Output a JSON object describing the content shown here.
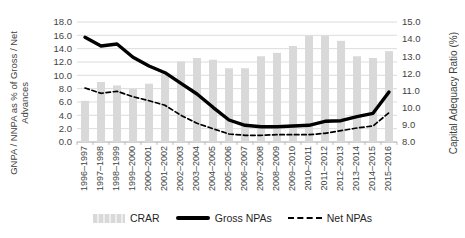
{
  "chart_data": {
    "type": "bar",
    "subtype": "combo-bar-line-dual-axis",
    "categories": [
      "1996–1997",
      "1997–1998",
      "1998–1999",
      "1999–2000",
      "2000–2001",
      "2001–2002",
      "2002–2003",
      "2003–2004",
      "2004–2005",
      "2005–2006",
      "2006–2007",
      "2007–2008",
      "2008–2009",
      "2009–2010",
      "2010–2011",
      "2011–2012",
      "2012–2013",
      "2013–2014",
      "2014–2015",
      "2015–2016"
    ],
    "series": [
      {
        "name": "CRAR",
        "type": "bar",
        "axis": "right",
        "style": "solid",
        "values": [
          10.4,
          11.5,
          11.3,
          11.1,
          11.4,
          12.0,
          12.7,
          12.9,
          12.8,
          12.3,
          12.3,
          13.0,
          13.2,
          13.6,
          14.2,
          14.2,
          13.9,
          13.0,
          12.9,
          13.3
        ]
      },
      {
        "name": "Gross NPAs",
        "type": "line",
        "axis": "left",
        "style": "solid",
        "values": [
          15.7,
          14.4,
          14.7,
          12.7,
          11.4,
          10.4,
          8.8,
          7.2,
          5.2,
          3.3,
          2.5,
          2.3,
          2.3,
          2.4,
          2.5,
          3.1,
          3.2,
          3.8,
          4.3,
          7.5
        ]
      },
      {
        "name": "Net NPAs",
        "type": "line",
        "axis": "left",
        "style": "dashed",
        "values": [
          8.1,
          7.3,
          7.6,
          6.8,
          6.2,
          5.5,
          4.0,
          2.8,
          2.0,
          1.2,
          1.0,
          1.0,
          1.1,
          1.1,
          1.1,
          1.3,
          1.7,
          2.1,
          2.4,
          4.4
        ]
      }
    ],
    "left_axis": {
      "title": "GNPA / NNPA as % of Gross / Net Advances",
      "title_lines": [
        "GNPA / NNPA as % of Gross / Net",
        "Advances"
      ],
      "min": 0,
      "max": 18,
      "step": 2,
      "tick_labels": [
        "18.0",
        "16.0",
        "14.0",
        "12.0",
        "10.0",
        "8.0",
        "6.0",
        "4.0",
        "2.0",
        "0.0"
      ]
    },
    "right_axis": {
      "title": "Capital Adequacy Ratio (%)",
      "min": 8,
      "max": 15,
      "step": 1,
      "tick_labels": [
        "15.0",
        "14.0",
        "13.0",
        "12.0",
        "11.0",
        "10.0",
        "9.0",
        "8.0"
      ]
    },
    "legend_position": "bottom",
    "grid": "horizontal",
    "colors": {
      "bar": "#d9d9d9",
      "line": "#000000",
      "grid": "#dcdcdc",
      "axis": "#a6a6a6",
      "text": "#3f3f3f"
    }
  }
}
